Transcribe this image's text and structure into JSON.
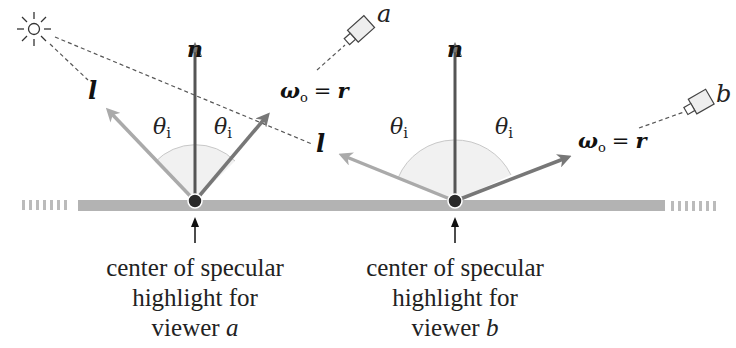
{
  "figure": {
    "labels": {
      "normal": "n",
      "light": "l",
      "omega": "ω",
      "omega_sub": "o",
      "equals": "=",
      "reflect": "r",
      "theta": "θ",
      "theta_sub": "i",
      "viewer_a": "a",
      "viewer_b": "b"
    },
    "captions": {
      "a": [
        "center of specular",
        "highlight for",
        "viewer "
      ],
      "a_var": "a",
      "b": [
        "center of specular",
        "highlight for",
        "viewer "
      ],
      "b_var": "b"
    },
    "colors": {
      "surface": "#b3b3b3",
      "normal_arrow": "#555555",
      "light_arrow": "#aaaaaa",
      "reflect_arrow": "#777777",
      "arc_fill": "#f2f2f2",
      "arc_stroke": "#c8c8c8",
      "point": "#2a2a2a",
      "dash": "#555555"
    }
  }
}
